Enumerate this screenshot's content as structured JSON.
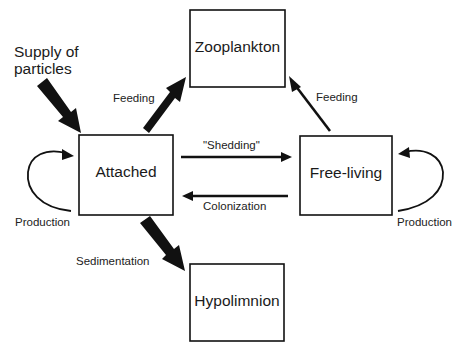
{
  "diagram": {
    "title": "",
    "nodes": {
      "zooplankton": {
        "label": "Zooplankton"
      },
      "attached": {
        "label": "Attached"
      },
      "free_living": {
        "label": "Free-living"
      },
      "hypolimnion": {
        "label": "Hypolimnion"
      }
    },
    "inputs": {
      "supply": {
        "line1": "Supply of",
        "line2": "particles"
      }
    },
    "edges": {
      "feeding_attached": {
        "label": "Feeding",
        "from": "Attached",
        "to": "Zooplankton",
        "style": "thick"
      },
      "feeding_free": {
        "label": "Feeding",
        "from": "Free-living",
        "to": "Zooplankton",
        "style": "thin"
      },
      "shedding": {
        "label": "\"Shedding\"",
        "from": "Attached",
        "to": "Free-living",
        "style": "thin"
      },
      "colonization": {
        "label": "Colonization",
        "from": "Free-living",
        "to": "Attached",
        "style": "thin"
      },
      "sedimentation": {
        "label": "Sedimentation",
        "from": "Attached",
        "to": "Hypolimnion",
        "style": "thick"
      },
      "production_attached": {
        "label": "Production",
        "from": "Attached",
        "to": "Attached",
        "style": "loop"
      },
      "production_free": {
        "label": "Production",
        "from": "Free-living",
        "to": "Free-living",
        "style": "loop"
      },
      "supply_arrow": {
        "from": "Supply of particles",
        "to": "Attached",
        "style": "thick"
      }
    },
    "colors": {
      "line": "#111111",
      "background": "#ffffff"
    }
  }
}
